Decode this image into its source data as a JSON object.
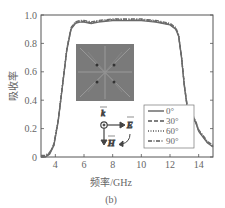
{
  "chart_data": {
    "type": "line",
    "title": "",
    "caption": "(b)",
    "xlabel": "频率/GHz",
    "ylabel": "吸收率",
    "xlim": [
      3,
      15
    ],
    "ylim": [
      0,
      1.0
    ],
    "xticks": [
      "4",
      "6",
      "8",
      "10",
      "12",
      "14"
    ],
    "yticks": [
      "0",
      "0.2",
      "0.4",
      "0.6",
      "0.8",
      "1.0"
    ],
    "grid": false,
    "legend_position": "lower right",
    "x": [
      3.0,
      3.3,
      3.6,
      3.9,
      4.2,
      4.5,
      4.8,
      5.1,
      5.4,
      5.7,
      6.0,
      6.5,
      7.0,
      8.0,
      9.0,
      10.0,
      11.0,
      12.0,
      12.4,
      12.6,
      12.8,
      13.0,
      13.2,
      13.4,
      13.6,
      13.8,
      14.0,
      14.3,
      14.6,
      15.0
    ],
    "series": [
      {
        "name": "0°",
        "style": "solid",
        "values": [
          0.0,
          0.0,
          0.02,
          0.08,
          0.25,
          0.5,
          0.75,
          0.9,
          0.94,
          0.95,
          0.95,
          0.94,
          0.95,
          0.96,
          0.96,
          0.96,
          0.95,
          0.93,
          0.9,
          0.85,
          0.7,
          0.5,
          0.35,
          0.3,
          0.28,
          0.24,
          0.18,
          0.14,
          0.1,
          0.07
        ]
      },
      {
        "name": "30°",
        "style": "dashed",
        "values": [
          0.0,
          0.0,
          0.02,
          0.08,
          0.25,
          0.5,
          0.75,
          0.9,
          0.94,
          0.95,
          0.95,
          0.94,
          0.95,
          0.96,
          0.96,
          0.96,
          0.95,
          0.93,
          0.9,
          0.85,
          0.7,
          0.5,
          0.35,
          0.3,
          0.28,
          0.24,
          0.18,
          0.14,
          0.1,
          0.07
        ]
      },
      {
        "name": "60°",
        "style": "dotted",
        "values": [
          0.0,
          0.0,
          0.02,
          0.08,
          0.25,
          0.5,
          0.75,
          0.9,
          0.94,
          0.95,
          0.95,
          0.94,
          0.95,
          0.96,
          0.96,
          0.96,
          0.95,
          0.93,
          0.9,
          0.85,
          0.7,
          0.5,
          0.35,
          0.3,
          0.28,
          0.24,
          0.18,
          0.14,
          0.1,
          0.07
        ]
      },
      {
        "name": "90°",
        "style": "dash-dot",
        "values": [
          0.0,
          0.0,
          0.02,
          0.08,
          0.25,
          0.5,
          0.75,
          0.9,
          0.94,
          0.95,
          0.95,
          0.94,
          0.95,
          0.96,
          0.96,
          0.96,
          0.95,
          0.93,
          0.9,
          0.85,
          0.7,
          0.5,
          0.35,
          0.3,
          0.28,
          0.24,
          0.18,
          0.14,
          0.1,
          0.07
        ]
      }
    ],
    "annotations": [
      "inset: metasurface unit cell (gray square with crossed diagonal lines and four dots)",
      "k (circle-dot)",
      "E (right arrow)",
      "H (down arrow)",
      "curved rotation arrow"
    ]
  },
  "inset": {
    "k_label": "k",
    "e_label": "E",
    "h_label": "H"
  },
  "colors": {
    "line": "#6a6a6a",
    "axis": "#555555",
    "inset_fill": "#7a7a7a",
    "inset_lines": "#9a9a9a"
  }
}
